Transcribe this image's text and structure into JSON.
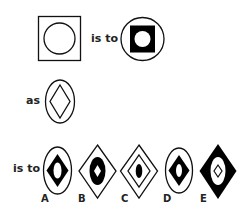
{
  "puzzle": {
    "connector_is_to": "is to",
    "connector_as": "as",
    "connector_is_to_2": "is to",
    "option_labels": [
      "A",
      "B",
      "C",
      "D",
      "E"
    ]
  },
  "colors": {
    "stroke": "#111111",
    "fill": "#000000",
    "background": "#ffffff"
  }
}
